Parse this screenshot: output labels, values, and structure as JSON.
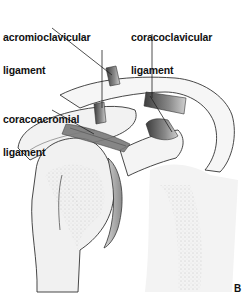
{
  "figure": {
    "panel_letter": "B",
    "labels": [
      {
        "id": "acromioclavicular",
        "line1": "acromioclavicular",
        "line2": "ligament"
      },
      {
        "id": "coracoclavicular",
        "line1": "coracoclavicular",
        "line2": "ligament"
      },
      {
        "id": "coracoacromial",
        "line1": "coracoacromial",
        "line2": "ligament"
      }
    ]
  },
  "colors": {
    "background": "#ffffff",
    "bone_fill": "#f2f2f2",
    "outline": "#333333",
    "ligament": "#7a7a7a",
    "ligament_dark": "#4a4a4a",
    "stipple": "#9a9a9a",
    "text": "#111111"
  }
}
